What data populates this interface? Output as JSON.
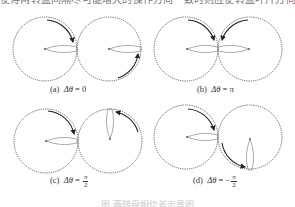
{
  "top_text": "使得两转盘间隔尽可能增大的操作方向一致时则应使转盘叶片方向保持一致相同",
  "panels": [
    {
      "id": "a",
      "label_prefix": "(a)",
      "delta_symbol": "Δθ",
      "equals": "=",
      "value": "0",
      "value_is_fraction": false
    },
    {
      "id": "b",
      "label_prefix": "(b)",
      "delta_symbol": "Δθ",
      "equals": "=",
      "value": "π",
      "value_is_fraction": false
    },
    {
      "id": "c",
      "label_prefix": "(c)",
      "delta_symbol": "Δθ",
      "equals": "=",
      "sign": "",
      "numerator": "π",
      "denominator": "2",
      "value_is_fraction": true
    },
    {
      "id": "d",
      "label_prefix": "(d)",
      "delta_symbol": "Δθ",
      "equals": "=",
      "sign": "−",
      "numerator": "π",
      "denominator": "2",
      "value_is_fraction": true
    }
  ],
  "figure_caption": "图 两转盘相位差示意图",
  "colors": {
    "circle_stroke": "#555555",
    "petal_stroke": "#888888",
    "arrow": "#222222"
  }
}
